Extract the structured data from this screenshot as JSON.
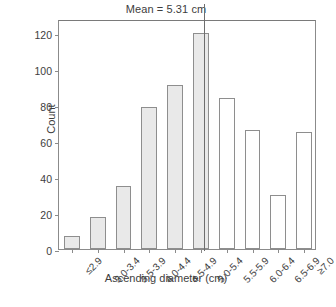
{
  "chart_data": {
    "type": "bar",
    "title": "Mean = 5.31 cm",
    "xlabel": "Ascending diameter (cm)",
    "ylabel": "Count",
    "categories": [
      "≤2.9",
      "3.0-3.4",
      "3.5-3.9",
      "4.0-4.4",
      "4.5-4.9",
      "5.0-5.4",
      "5.5-5.9",
      "6.0-6.4",
      "6.5-6.9",
      "≥7.0"
    ],
    "values": [
      7,
      18,
      35,
      79,
      91,
      120,
      84,
      66,
      30,
      65
    ],
    "bar_styles": [
      "filled",
      "filled",
      "filled",
      "filled",
      "filled",
      "filled",
      "open",
      "open",
      "open",
      "open"
    ],
    "ylim": [
      0,
      128
    ],
    "yticks": [
      0,
      20,
      40,
      60,
      80,
      100,
      120
    ],
    "ytick_labels": [
      "0",
      "20",
      "40",
      "60",
      "80",
      "100",
      "120"
    ],
    "grid": false,
    "legend": null,
    "annotations": [
      {
        "name": "mean-line",
        "type": "vline",
        "label": "Mean = 5.31 cm",
        "value": 5.31,
        "category_index": 5,
        "position_fraction": 0.62
      }
    ],
    "colors": {
      "bar_fill": "#e9e9e9",
      "bar_open_fill": "#ffffff",
      "bar_stroke": "#8e8e8e",
      "axis": "#8b8b8b",
      "text": "#3d3d3d",
      "background": "#ffffff"
    }
  }
}
